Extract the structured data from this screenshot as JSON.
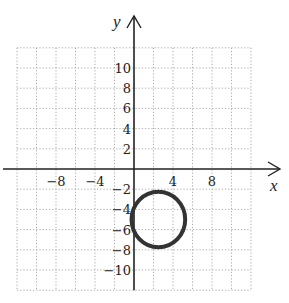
{
  "chart_data": {
    "type": "scatter",
    "title": "",
    "xlabel": "x",
    "ylabel": "y",
    "xlim": [
      -12,
      12
    ],
    "ylim": [
      -12,
      12
    ],
    "grid": true,
    "grid_step": 2,
    "x_tick_labels": [
      "−8",
      "−4",
      "4",
      "8"
    ],
    "x_tick_values": [
      -8,
      -4,
      4,
      8
    ],
    "y_tick_labels": [
      "10",
      "8",
      "6",
      "4",
      "2",
      "−2",
      "−4",
      "−6",
      "−8",
      "−10"
    ],
    "y_tick_values": [
      10,
      8,
      6,
      4,
      2,
      -2,
      -4,
      -6,
      -8,
      -10
    ],
    "shapes": [
      {
        "kind": "circle",
        "center": [
          2.5,
          -5
        ],
        "radius": 2.75,
        "stroke": "#333333"
      }
    ],
    "legend": null
  },
  "colors": {
    "axis": "#222222",
    "grid": "#aaaaaa",
    "curve": "#333333"
  }
}
